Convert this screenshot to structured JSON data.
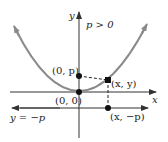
{
  "diagram": {
    "condition": "p > 0",
    "axes": {
      "x_label": "x",
      "y_label": "y"
    },
    "points": {
      "vertex": "(0, 0)",
      "focus": "(0, p)",
      "point_on_curve": "(x, y)",
      "directrix_point": "(x, −p)"
    },
    "directrix_label": "y = −p",
    "colors": {
      "curve": "#8a8a8a",
      "axes": "#333333",
      "points": "#111111"
    }
  }
}
